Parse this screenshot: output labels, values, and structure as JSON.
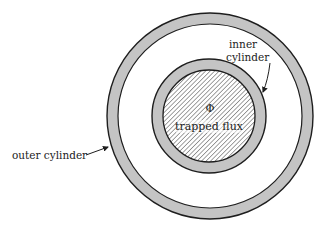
{
  "diagram": {
    "labels": {
      "inner_line1": "inner",
      "inner_line2": "cylinder",
      "outer": "outer cylinder",
      "phi": "Φ",
      "flux": "trapped flux"
    },
    "colors": {
      "ring_fill": "#c4c4c4",
      "stroke": "#1e1e1e",
      "hatch": "#555555",
      "background": "#ffffff"
    }
  }
}
